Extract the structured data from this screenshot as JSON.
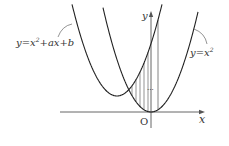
{
  "figure": {
    "width": 229,
    "height": 146,
    "colors": {
      "curve": "#222222",
      "axis": "#555555",
      "hatch": "#666666",
      "text": "#333333"
    },
    "axes": {
      "origin_px": [
        151,
        112
      ],
      "x_axis": {
        "from": 60,
        "to": 205,
        "label": "x"
      },
      "y_axis": {
        "from": 128,
        "to": 11,
        "label": "y"
      },
      "origin_label": "O"
    },
    "curves": [
      {
        "name": "y=x^2",
        "vertex_px": [
          151,
          112
        ],
        "k": 0.0453,
        "x_from": 103,
        "x_to": 198
      },
      {
        "name": "y=x^2+ax+b",
        "vertex_px": [
          117,
          96
        ],
        "k": 0.0453,
        "x_from": 72,
        "x_to": 162
      }
    ],
    "hatch_lines_x": [
      132,
      136,
      140,
      144,
      148
    ],
    "tall_line_x": 158,
    "dots": {
      "x": 154,
      "y": 90,
      "text": "···"
    },
    "labels": {
      "left_curve": {
        "prefix": "y=x",
        "exp": "2",
        "suffix": "+ax+b"
      },
      "right_curve": {
        "prefix": "y=x",
        "exp": "2"
      }
    }
  }
}
